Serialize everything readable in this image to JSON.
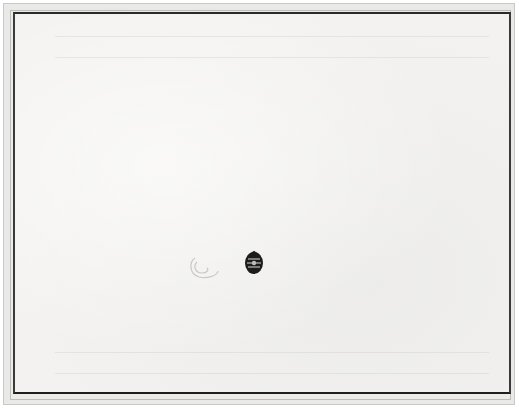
{
  "image": {
    "description": "Photograph of a framed, mostly blank sheet of paper with a faint embossed swirl and a small dark oval emblem near the lower center",
    "elements": {
      "frame": {
        "color": "#e9e9e7"
      },
      "sheet": {
        "color": "#f3f2f0",
        "border_color": "#2a2a2a"
      },
      "swirl": {
        "shape": "embossed-swirl",
        "color": "#c8c8c6"
      },
      "emblem": {
        "shape": "dark-oval-emblem",
        "color": "#1c1c1c"
      }
    }
  }
}
